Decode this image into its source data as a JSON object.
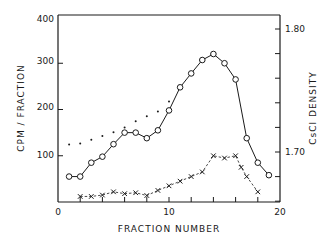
{
  "chart_data": {
    "type": "line",
    "title": "",
    "xlabel": "FRACTION NUMBER",
    "ylabel": "CPM / FRACTION",
    "y2label": "CsCl DENSITY",
    "xlim": [
      0,
      20
    ],
    "ylim": [
      0,
      400
    ],
    "y2lim": [
      1.64,
      1.82
    ],
    "x_ticks": [
      0,
      10,
      20
    ],
    "y_ticks": [
      100,
      200,
      300,
      400
    ],
    "y2_ticks": [
      1.7,
      1.8
    ],
    "y2_tick_labels": [
      "1.70",
      "1.80"
    ],
    "grid": false,
    "legend": null,
    "series": [
      {
        "name": "circles",
        "marker": "o",
        "line": "solid",
        "axis": "left",
        "x": [
          1,
          2,
          3,
          4,
          5,
          6,
          7,
          8,
          9,
          10,
          11,
          12,
          13,
          14,
          15,
          16,
          17,
          18,
          19
        ],
        "values": [
          55,
          55,
          85,
          98,
          125,
          150,
          150,
          138,
          155,
          198,
          248,
          278,
          307,
          320,
          300,
          265,
          138,
          85,
          58
        ]
      },
      {
        "name": "crosses",
        "marker": "x",
        "line": "dashed",
        "axis": "left",
        "x": [
          2,
          3,
          4,
          5,
          6,
          7,
          8,
          9,
          10,
          11,
          12,
          13,
          14,
          15,
          16,
          16.5,
          17,
          18
        ],
        "values": [
          12,
          12,
          15,
          22,
          18,
          20,
          14,
          25,
          35,
          45,
          55,
          65,
          100,
          95,
          100,
          75,
          55,
          22
        ]
      },
      {
        "name": "density",
        "marker": ".",
        "line": "none",
        "axis": "right",
        "x": [
          1,
          2,
          3,
          4,
          5,
          6,
          7,
          8,
          9,
          10,
          11,
          12,
          13,
          14
        ],
        "values": [
          1.706,
          1.707,
          1.71,
          1.713,
          1.716,
          1.72,
          1.725,
          1.729,
          1.733,
          1.741,
          1.752,
          1.765,
          1.776,
          1.78
        ]
      }
    ]
  },
  "labels": {
    "xlabel": "FRACTION NUMBER",
    "ylabel": "CPM / FRACTION",
    "y2label": "CsCl DENSITY",
    "x0": "0",
    "x10": "10",
    "x20": "20",
    "y100": "100",
    "y200": "200",
    "y300": "300",
    "y400": "400",
    "y2_170": "1.70",
    "y2_180": "1.80"
  }
}
